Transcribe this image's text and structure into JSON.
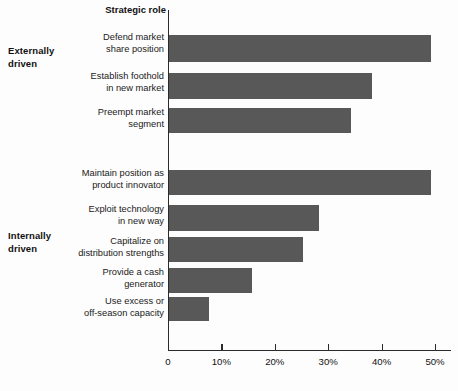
{
  "chart_data": {
    "type": "bar",
    "orientation": "horizontal",
    "title": "Strategic role",
    "xlabel": "",
    "ylabel": "",
    "xlim": [
      0,
      53
    ],
    "grid": false,
    "legend": null,
    "bar_color": "#585858",
    "axis_color": "#2b2b2b",
    "tick_labels": [
      "0",
      "10%",
      "20%",
      "30%",
      "40%",
      "50%"
    ],
    "tick_values": [
      0,
      10,
      20,
      30,
      40,
      50
    ],
    "groups": [
      {
        "label": "Externally\ndriven",
        "categories": [
          0,
          1,
          2
        ]
      },
      {
        "label": "Internally\ndriven",
        "categories": [
          3,
          4,
          5,
          6,
          7
        ]
      }
    ],
    "categories": [
      "Defend market\nshare position",
      "Establish foothold\nin new market",
      "Preempt market\nsegment",
      "Maintain position as\nproduct innovator",
      "Exploit technology\nin new way",
      "Capitalize on\ndistribution strengths",
      "Provide a cash\ngenerator",
      "Use excess or\noff-season capacity"
    ],
    "values": [
      49,
      38,
      34,
      49,
      28,
      25,
      15.5,
      7.5
    ]
  },
  "layout": {
    "bars": [
      {
        "top": 35,
        "height": 27
      },
      {
        "top": 73,
        "height": 26
      },
      {
        "top": 108,
        "height": 25
      },
      {
        "top": 170,
        "height": 25
      },
      {
        "top": 205,
        "height": 26
      },
      {
        "top": 237,
        "height": 25
      },
      {
        "top": 268,
        "height": 25
      },
      {
        "top": 297,
        "height": 24
      }
    ],
    "label_tops": [
      32,
      71,
      107,
      168,
      204,
      236,
      267,
      296
    ],
    "plot_left": 168,
    "plot_top": 10,
    "plot_width": 283,
    "px_per_unit": 5.34
  }
}
